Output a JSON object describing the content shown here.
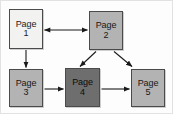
{
  "diagram": {
    "type": "flowchart",
    "background_color": "#fdfdfd",
    "frame_border_color": "#e2e2e2",
    "node_border_color": "#4a4a4a",
    "edge_color": "#1a1a1a",
    "palette": {
      "light": "#f2f2f0",
      "mid": "#b3b3b3",
      "dark": "#6e6e6e"
    },
    "nodes": [
      {
        "id": "page1",
        "word": "Page",
        "number": "1",
        "shade": "light",
        "fill": "#f2f2f0",
        "x": 8,
        "y": 8,
        "w": 34,
        "h": 40
      },
      {
        "id": "page2",
        "word": "Page",
        "number": "2",
        "shade": "mid",
        "fill": "#b3b3b3",
        "x": 88,
        "y": 10,
        "w": 34,
        "h": 39
      },
      {
        "id": "page3",
        "word": "Page",
        "number": "3",
        "shade": "mid",
        "fill": "#b3b3b3",
        "x": 8,
        "y": 68,
        "w": 34,
        "h": 38
      },
      {
        "id": "page4",
        "word": "Page",
        "number": "4",
        "shade": "dark",
        "fill": "#6e6e6e",
        "x": 64,
        "y": 67,
        "w": 35,
        "h": 39
      },
      {
        "id": "page5",
        "word": "Page",
        "number": "5",
        "shade": "mid",
        "fill": "#b3b3b3",
        "x": 130,
        "y": 68,
        "w": 34,
        "h": 38
      }
    ],
    "edges": [
      {
        "id": "e1",
        "from": "page1",
        "to": "page2",
        "direction": "bidirectional",
        "style": "horizontal"
      },
      {
        "id": "e2",
        "from": "page1",
        "to": "page3",
        "direction": "forward",
        "style": "vertical"
      },
      {
        "id": "e3",
        "from": "page3",
        "to": "page4",
        "direction": "forward",
        "style": "horizontal"
      },
      {
        "id": "e4",
        "from": "page4",
        "to": "page5",
        "direction": "forward",
        "style": "horizontal"
      },
      {
        "id": "e5",
        "from": "page2",
        "to": "page4",
        "direction": "forward",
        "style": "diagonal"
      },
      {
        "id": "e6",
        "from": "page2",
        "to": "page5",
        "direction": "forward",
        "style": "diagonal"
      }
    ]
  }
}
